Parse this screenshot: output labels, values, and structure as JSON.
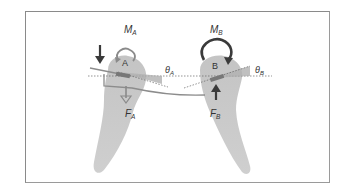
{
  "diagram": {
    "teeth": [
      {
        "id": "A",
        "bracket_label": "A",
        "moment_label": "M",
        "moment_sub": "A",
        "force_label": "F",
        "force_sub": "A",
        "angle_label": "θ",
        "angle_sub": "A",
        "moment_direction": "clockwise-small",
        "force_direction": "down",
        "applied_force_direction": "down"
      },
      {
        "id": "B",
        "bracket_label": "B",
        "moment_label": "M",
        "moment_sub": "B",
        "force_label": "F",
        "force_sub": "B",
        "angle_label": "θ",
        "angle_sub": "B",
        "moment_direction": "clockwise-large",
        "force_direction": "up"
      }
    ],
    "colors": {
      "tooth_fill": "#c8c8c8",
      "arrow_dark": "#3a3a3a",
      "arrow_light": "#8a8a8a",
      "wire": "#8c8c8c",
      "angle_wedge": "#b4b4b4",
      "reference_line": "#666666",
      "frame": "#8a8a8a"
    }
  }
}
